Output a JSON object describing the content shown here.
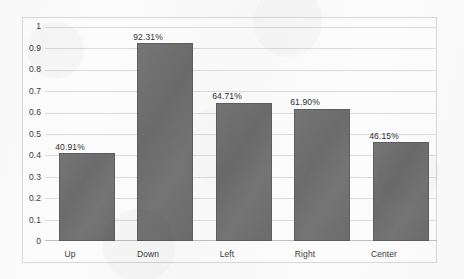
{
  "chart_data": {
    "type": "bar",
    "title": "",
    "subtitle": "",
    "xlabel": "",
    "ylabel": "",
    "categories": [
      "Up",
      "Down",
      "Left",
      "Right",
      "Center"
    ],
    "values": [
      0.4091,
      0.9231,
      0.6471,
      0.619,
      0.4615
    ],
    "data_labels": [
      "40.91%",
      "92.31%",
      "64.71%",
      "61.90%",
      "46.15%"
    ],
    "series": [
      {
        "name": "Accuracy",
        "values": [
          0.4091,
          0.9231,
          0.6471,
          0.619,
          0.4615
        ],
        "color": "#6f6f6f"
      }
    ],
    "ylim": [
      0,
      1
    ],
    "ytick_values": [
      0,
      0.1,
      0.2,
      0.3,
      0.4,
      0.5,
      0.6,
      0.7,
      0.8,
      0.9,
      1
    ],
    "ytick_labels": [
      "0",
      "0.1",
      "0.2",
      "0.3",
      "0.4",
      "0.5",
      "0.6",
      "0.7",
      "0.8",
      "0.9",
      "1"
    ],
    "grid": true,
    "grid_axis": "y",
    "legend": false,
    "legend_position": "none",
    "bar_color": "#6f6f6f",
    "bar_border_color": "#5e5e5e",
    "gridline_color": "#dcdcdc",
    "plot_border_color": "#d8d8d8",
    "background_color": "#fbfbfb",
    "label_text_color": "#2e2e2e",
    "tick_text_color": "#3b3b3b"
  }
}
